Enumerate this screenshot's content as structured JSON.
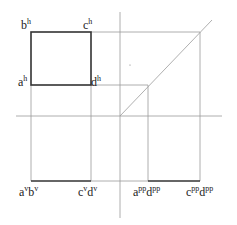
{
  "diagram": {
    "type": "orthographic-projection",
    "colors": {
      "thin_line": "#9a9a9a",
      "thick_line": "#333333",
      "text": "#222222"
    },
    "axes": {
      "vertical": {
        "x": 120,
        "y1": 12,
        "y2": 218
      },
      "horizontal": {
        "y": 116,
        "x1": 16,
        "x2": 222
      }
    },
    "top_view": {
      "label": "horizontal projection square",
      "x1": 31,
      "y1": 32,
      "x2": 91,
      "y2": 85
    },
    "labels": {
      "bh": {
        "base": "b",
        "sup": "h"
      },
      "ch": {
        "base": "c",
        "sup": "h"
      },
      "ah": {
        "base": "a",
        "sup": "h"
      },
      "dh": {
        "base": "d",
        "sup": "h"
      },
      "avbv": {
        "base1": "a",
        "sup1": "v",
        "base2": "b",
        "sup2": "v"
      },
      "cvdv": {
        "base1": "c",
        "sup1": "v",
        "base2": "d",
        "sup2": "v"
      },
      "appdpp": {
        "base1": "a",
        "sup1": "pp",
        "base2": "d",
        "sup2": "pp"
      },
      "cppdpp": {
        "base1": "c",
        "sup1": "pp",
        "base2": "d",
        "sup2": "pp"
      }
    }
  }
}
